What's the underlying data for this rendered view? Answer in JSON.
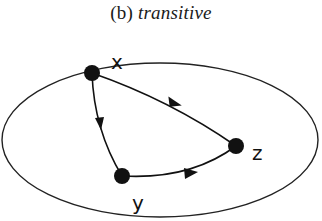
{
  "figure": {
    "caption_prefix": "(b)",
    "caption_text": "transitive",
    "title": "(b) transitive"
  },
  "diagram": {
    "type": "directed-graph",
    "container": {
      "shape": "ellipse",
      "cx": 160,
      "cy": 140,
      "rx": 158,
      "ry": 78
    },
    "nodes": [
      {
        "id": "x",
        "label": "x",
        "cx": 92,
        "cy": 73
      },
      {
        "id": "y",
        "label": "y",
        "cx": 122,
        "cy": 176
      },
      {
        "id": "z",
        "label": "z",
        "cx": 236,
        "cy": 146
      }
    ],
    "edges": [
      {
        "from": "x",
        "to": "z"
      },
      {
        "from": "x",
        "to": "y"
      },
      {
        "from": "y",
        "to": "z"
      }
    ],
    "colors": {
      "ink": "#111111",
      "background": "#ffffff"
    }
  }
}
